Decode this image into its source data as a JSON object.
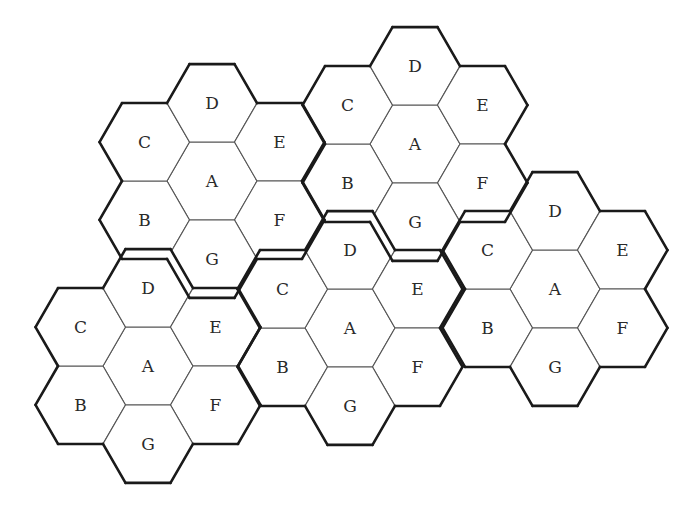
{
  "diagram": {
    "type": "hexagonal-cell-cluster",
    "hex_radius": 45,
    "cell_labels_order": [
      "A",
      "B",
      "C",
      "D",
      "E",
      "F",
      "G"
    ],
    "clusters": [
      {
        "id": 1,
        "center": [
          212,
          181
        ],
        "cells": {
          "A": "A",
          "B": "B",
          "C": "C",
          "D": "D",
          "E": "E",
          "F": "F",
          "G": "G"
        }
      },
      {
        "id": 2,
        "center": [
          415,
          144
        ],
        "cells": {
          "A": "A",
          "B": "B",
          "C": "C",
          "D": "D",
          "E": "E",
          "F": "F",
          "G": "G"
        }
      },
      {
        "id": 3,
        "center": [
          555,
          289
        ],
        "cells": {
          "A": "A",
          "B": "B",
          "C": "C",
          "D": "D",
          "E": "E",
          "F": "F",
          "G": "G"
        }
      },
      {
        "id": 4,
        "center": [
          148,
          366
        ],
        "cells": {
          "A": "A",
          "B": "B",
          "C": "C",
          "D": "D",
          "E": "E",
          "F": "F",
          "G": "G"
        }
      },
      {
        "id": 5,
        "center": [
          350,
          328
        ],
        "cells": {
          "A": "A",
          "B": "B",
          "C": "C",
          "D": "D",
          "E": "E",
          "F": "F",
          "G": "G"
        }
      }
    ],
    "colors": {
      "cell_fill": "#ffffff",
      "cell_border": "#555555",
      "cluster_border": "#1a1a1a",
      "text": "#2a2a2a"
    }
  }
}
